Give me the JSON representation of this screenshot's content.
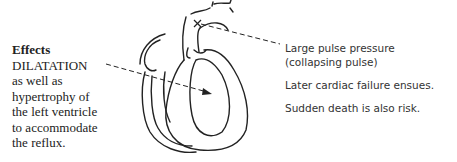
{
  "effects": {
    "title": "Effects",
    "lines": [
      "DILATATION",
      "as well as",
      "hypertrophy of",
      "the left ventricle",
      "to accommodate",
      "the reflux."
    ]
  },
  "annotations": [
    {
      "lines": [
        "Large pulse pressure",
        "(collapsing pulse)"
      ]
    },
    {
      "lines": [
        "Later cardiac failure ensues."
      ]
    },
    {
      "lines": [
        "Sudden death is also risk."
      ]
    }
  ],
  "diagram": {
    "line_color": "#222222"
  }
}
